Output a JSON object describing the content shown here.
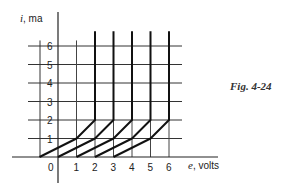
{
  "figure": {
    "caption": "Fig. 4-24"
  },
  "axes": {
    "y_label_var": "i",
    "y_label_unit": ", ma",
    "x_label_var": "e",
    "x_label_unit": ", volts",
    "origin_label": "0"
  },
  "chart_data": {
    "type": "line",
    "title": "Fig. 4-24",
    "xlabel": "e, volts",
    "ylabel": "i, ma",
    "x_ticks": [
      0,
      1,
      2,
      3,
      4,
      5,
      6
    ],
    "y_ticks": [
      1,
      2,
      3,
      4,
      5,
      6
    ],
    "xlim": [
      -2.5,
      6.7
    ],
    "ylim": [
      -1.4,
      7.1
    ],
    "grid": true,
    "legend": null,
    "series": [
      {
        "name": "curve-1",
        "points": [
          [
            -1,
            0
          ],
          [
            1,
            1
          ],
          [
            2,
            2
          ],
          [
            2,
            6.8
          ]
        ]
      },
      {
        "name": "curve-2",
        "points": [
          [
            0,
            0
          ],
          [
            2,
            1
          ],
          [
            3,
            2
          ],
          [
            3,
            6.8
          ]
        ]
      },
      {
        "name": "curve-3",
        "points": [
          [
            1,
            0
          ],
          [
            3,
            1
          ],
          [
            4,
            2
          ],
          [
            4,
            6.8
          ]
        ]
      },
      {
        "name": "curve-4",
        "points": [
          [
            2,
            0
          ],
          [
            4,
            1
          ],
          [
            5,
            2
          ],
          [
            5,
            6.8
          ]
        ]
      },
      {
        "name": "curve-5",
        "points": [
          [
            3,
            0
          ],
          [
            5,
            1
          ],
          [
            6,
            2
          ],
          [
            6,
            6.8
          ]
        ]
      }
    ]
  }
}
